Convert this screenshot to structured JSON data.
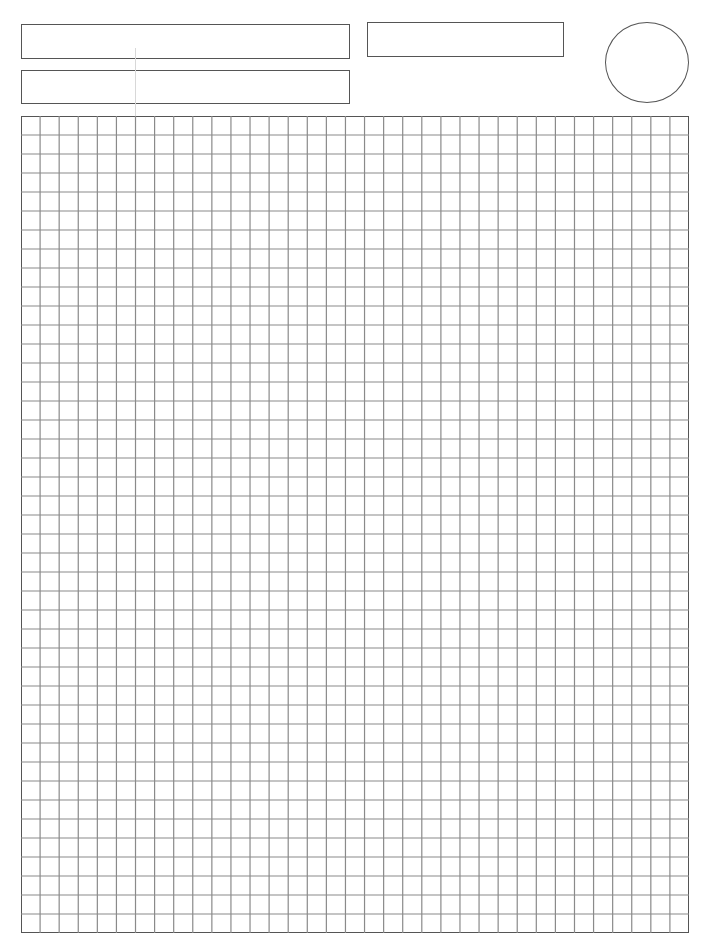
{
  "page": {
    "type": "blank graph paper worksheet",
    "background": "#ffffff",
    "line_color": "#555555",
    "grid_line_color": "#8a8a8a"
  },
  "header": {
    "boxes": [
      {
        "id": "field-1",
        "label": "",
        "value": ""
      },
      {
        "id": "field-2",
        "label": "",
        "value": ""
      },
      {
        "id": "field-3",
        "label": "",
        "value": ""
      }
    ],
    "circle": {
      "label": "",
      "value": ""
    }
  },
  "grid": {
    "columns": 35,
    "rows": 43
  }
}
